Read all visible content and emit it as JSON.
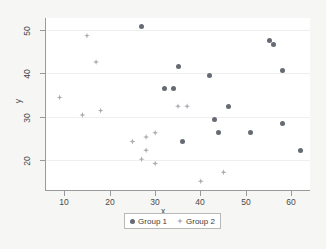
{
  "chart_data": {
    "type": "scatter",
    "title": "",
    "xlabel": "x",
    "ylabel": "y",
    "xlim": [
      6,
      64
    ],
    "ylim": [
      14,
      53
    ],
    "xticks": [
      10,
      20,
      30,
      40,
      50,
      60
    ],
    "yticks": [
      20,
      30,
      40,
      50
    ],
    "grid": true,
    "legend_position": "bottom-center",
    "colors": {
      "group1": "#666a72",
      "group2": "#a9aab0",
      "plot_background": "#ffffff",
      "figure_background": "#f6f6f4",
      "axis": "#9a9a9a",
      "gridline": "#f0eff0"
    },
    "series": [
      {
        "name": "Group 1",
        "marker": "circle",
        "color": "#666a72",
        "points": [
          [
            27,
            51
          ],
          [
            35,
            42
          ],
          [
            42,
            40
          ],
          [
            55,
            48
          ],
          [
            56,
            47
          ],
          [
            58,
            41
          ],
          [
            32,
            37
          ],
          [
            34,
            37
          ],
          [
            46,
            33
          ],
          [
            43,
            30
          ],
          [
            58,
            29
          ],
          [
            44,
            27
          ],
          [
            51,
            27
          ],
          [
            36,
            25
          ],
          [
            62,
            23
          ]
        ]
      },
      {
        "name": "Group 2",
        "marker": "diamond",
        "color": "#a9aab0",
        "points": [
          [
            15,
            49
          ],
          [
            17,
            43
          ],
          [
            9,
            35
          ],
          [
            18,
            32
          ],
          [
            14,
            31
          ],
          [
            35,
            33
          ],
          [
            37,
            33
          ],
          [
            30,
            27
          ],
          [
            28,
            26
          ],
          [
            25,
            25
          ],
          [
            28,
            23
          ],
          [
            27,
            21
          ],
          [
            30,
            20
          ],
          [
            45,
            18
          ],
          [
            40,
            16
          ]
        ]
      }
    ]
  },
  "axes": {
    "y_tick_labels": [
      "50",
      "40",
      "30",
      "20"
    ],
    "x_tick_labels": [
      "10",
      "20",
      "30",
      "40",
      "50",
      "60"
    ],
    "y_title": "y",
    "x_title": "x"
  },
  "legend": {
    "entries": [
      {
        "label": "Group 1",
        "key": "circle-marker-icon"
      },
      {
        "label": "Group 2",
        "key": "diamond-marker-icon"
      }
    ]
  }
}
